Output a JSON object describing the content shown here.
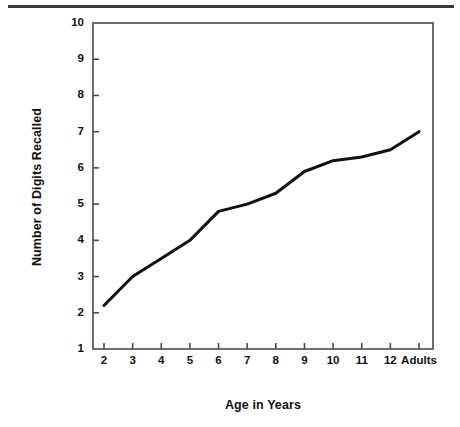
{
  "chart_data": {
    "type": "line",
    "title": "",
    "xlabel": "Age in Years",
    "ylabel": "Number of Digits Recalled",
    "categories": [
      "2",
      "3",
      "4",
      "5",
      "6",
      "7",
      "8",
      "9",
      "10",
      "11",
      "12",
      "Adults"
    ],
    "values": [
      2.2,
      3.0,
      3.5,
      4.0,
      4.8,
      5.0,
      5.3,
      5.9,
      6.2,
      6.3,
      6.5,
      7.0
    ],
    "series": [
      {
        "name": "Digit span",
        "values": [
          2.2,
          3.0,
          3.5,
          4.0,
          4.8,
          5.0,
          5.3,
          5.9,
          6.2,
          6.3,
          6.5,
          7.0
        ]
      }
    ],
    "ylim": [
      1,
      10
    ],
    "ytick_labels": [
      "1",
      "2",
      "3",
      "4",
      "5",
      "6",
      "7",
      "8",
      "9",
      "10"
    ],
    "ytick_values": [
      1,
      2,
      3,
      4,
      5,
      6,
      7,
      8,
      9,
      10
    ],
    "xtick_labels": [
      "2",
      "3",
      "4",
      "5",
      "6",
      "7",
      "8",
      "9",
      "10",
      "11",
      "12",
      "Adults"
    ],
    "grid": false,
    "legend": false,
    "legend_position": "none",
    "line_color": "#111111",
    "axis_color": "#4a4a4a",
    "background_color": "#ffffff"
  },
  "figure": {
    "top_rule_color": "#3a3a3a"
  }
}
